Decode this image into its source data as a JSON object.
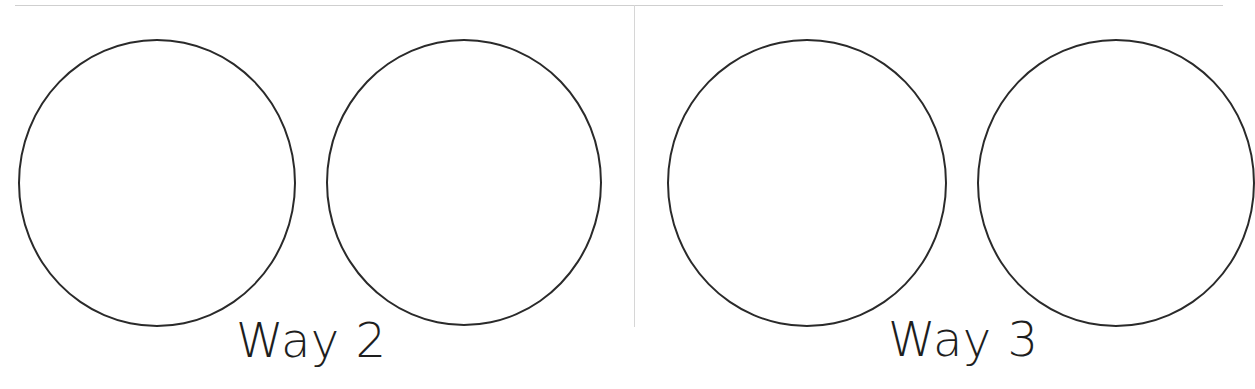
{
  "worksheet": {
    "panels": [
      {
        "label": "Way 2",
        "circles": 2
      },
      {
        "label": "Way 3",
        "circles": 2
      }
    ]
  }
}
